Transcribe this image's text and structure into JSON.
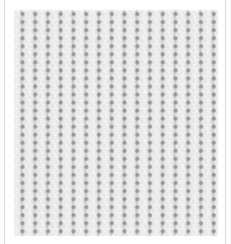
{
  "image": {
    "subject": "close-up of white knitted/woven fabric texture",
    "background_color": "#ffffff",
    "frame_color": "#dcdcdc",
    "fabric": {
      "base_color": "#d9d9d9",
      "rib_color": "#e8e8e8",
      "hole_color": "#8e8e8e",
      "columns": 16,
      "rows": 28
    }
  }
}
